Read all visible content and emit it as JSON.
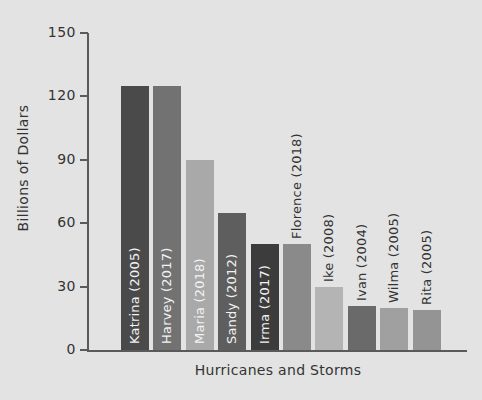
{
  "chart_data": {
    "type": "bar",
    "title": "",
    "xlabel": "Hurricanes and Storms",
    "ylabel": "Billions of Dollars",
    "ylim": [
      0,
      150
    ],
    "yticks": [
      0,
      30,
      60,
      90,
      120,
      150
    ],
    "ytick_labels": [
      "0",
      "30",
      "60",
      "90",
      "120",
      "150"
    ],
    "grid": false,
    "legend": null,
    "categories": [
      "Katrina (2005)",
      "Harvey (2017)",
      "Maria (2018)",
      "Sandy (2012)",
      "Irma (2017)",
      "Florence (2018)",
      "Ike (2008)",
      "Ivan (2004)",
      "Wilma (2005)",
      "Rita (2005)"
    ],
    "values": [
      125,
      125,
      90,
      65,
      50,
      50,
      30,
      21,
      20,
      19
    ],
    "bar_colors": [
      "#4a4a4a",
      "#727272",
      "#a9a9a9",
      "#5e5e5e",
      "#3c3c3c",
      "#8a8a8a",
      "#b4b4b4",
      "#6a6a6a",
      "#a0a0a0",
      "#949494"
    ],
    "label_placement": [
      "inside-light",
      "inside-light",
      "inside-light",
      "inside-light",
      "inside-light",
      "outside",
      "outside",
      "outside",
      "outside",
      "outside"
    ]
  },
  "style": {
    "background": "#e3e3e3",
    "axis_color": "#5a5a5a",
    "text_color": "#333333"
  }
}
